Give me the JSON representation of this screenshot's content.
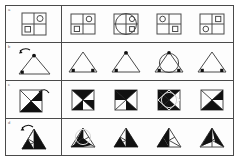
{
  "sheet": {
    "title": "Figure rotation reasoning worksheet",
    "width": 241,
    "height": 162,
    "background": "#ffffff",
    "line_color": "#4a4a4a",
    "fill_color": "#000000",
    "label_color": "#6b6b6b"
  },
  "layout": {
    "rows": 4,
    "options_per_row": 4,
    "question_column_width": 56,
    "frame": {
      "x": 5,
      "y": 5,
      "width": 229,
      "height": 151
    }
  },
  "rows": [
    {
      "label": "a",
      "prompt": {
        "name": "quad-grid-with-circle-and-square",
        "shape": "square-2x2-grid",
        "markers": [
          {
            "glyph": "circle",
            "cell": "top-right",
            "filled": false
          },
          {
            "glyph": "square",
            "cell": "bottom-left",
            "filled": false
          }
        ],
        "rotation_arrow": false
      },
      "options": [
        {
          "id": "a1",
          "shape": "square-2x2-grid",
          "markers": [
            {
              "glyph": "circle",
              "cell": "top-right",
              "filled": false
            },
            {
              "glyph": "square",
              "cell": "bottom-left",
              "filled": false
            }
          ],
          "overlay_circle": false
        },
        {
          "id": "a2",
          "shape": "square-2x2-grid",
          "markers": [
            {
              "glyph": "circle",
              "cell": "top-right",
              "filled": false
            },
            {
              "glyph": "square",
              "cell": "bottom-right",
              "filled": false
            }
          ],
          "overlay_circle": true
        },
        {
          "id": "a3",
          "shape": "square-2x2-grid",
          "markers": [
            {
              "glyph": "circle",
              "cell": "top-left",
              "filled": false
            },
            {
              "glyph": "square",
              "cell": "bottom-right",
              "filled": false
            }
          ],
          "overlay_circle": false
        },
        {
          "id": "a4",
          "shape": "square-2x2-grid",
          "markers": [
            {
              "glyph": "square",
              "cell": "top-right",
              "filled": false
            },
            {
              "glyph": "circle",
              "cell": "bottom-left",
              "filled": false
            }
          ],
          "overlay_circle": false
        }
      ]
    },
    {
      "label": "b",
      "prompt": {
        "name": "triangle-with-two-dots",
        "shape": "triangle",
        "markers": [
          {
            "glyph": "dot",
            "vertex": "apex",
            "filled": true
          },
          {
            "glyph": "dot",
            "vertex": "bottom-left",
            "filled": true
          }
        ],
        "rotation_arrow": true
      },
      "options": [
        {
          "id": "b1",
          "shape": "triangle",
          "markers": [
            {
              "glyph": "dot",
              "vertex": "bottom-left",
              "filled": true
            },
            {
              "glyph": "dot",
              "vertex": "bottom-right",
              "filled": true
            }
          ],
          "overlay_circle": false
        },
        {
          "id": "b2",
          "shape": "triangle",
          "markers": [
            {
              "glyph": "dot",
              "vertex": "apex",
              "filled": true
            },
            {
              "glyph": "dot",
              "vertex": "bottom-left",
              "filled": true
            }
          ],
          "overlay_circle": false
        },
        {
          "id": "b3",
          "shape": "triangle",
          "markers": [
            {
              "glyph": "dot",
              "vertex": "apex",
              "filled": true
            },
            {
              "glyph": "dot",
              "vertex": "bottom-left",
              "filled": true
            },
            {
              "glyph": "dot",
              "vertex": "bottom-right",
              "filled": true
            }
          ],
          "overlay_circle": true
        },
        {
          "id": "b4",
          "shape": "triangle",
          "markers": [
            {
              "glyph": "dot",
              "vertex": "bottom-left",
              "filled": true
            },
            {
              "glyph": "dot",
              "vertex": "bottom-right",
              "filled": true
            }
          ],
          "overlay_circle": false
        }
      ]
    },
    {
      "label": "c",
      "prompt": {
        "name": "square-quartered-by-diagonals",
        "shape": "square-diagonals",
        "filled_sectors": [
          "top-right-half",
          "bottom-left"
        ],
        "rotation_arrow": true
      },
      "options": [
        {
          "id": "c1",
          "shape": "square-diagonals",
          "filled_sectors": [
            "top",
            "right-lower"
          ],
          "overlay_circle": false
        },
        {
          "id": "c2",
          "shape": "square-diagonals",
          "filled_sectors": [
            "top",
            "bottom-right"
          ],
          "overlay_circle": false
        },
        {
          "id": "c3",
          "shape": "square-diagonals",
          "filled_sectors": [
            "top",
            "left",
            "bottom"
          ],
          "overlay_circle": true
        },
        {
          "id": "c4",
          "shape": "square-diagonals",
          "filled_sectors": [
            "right",
            "bottom-left"
          ],
          "overlay_circle": false
        }
      ]
    },
    {
      "label": "d",
      "prompt": {
        "name": "triangle-with-internal-lines",
        "shape": "triangle-subdivided",
        "filled_sectors": [
          "right-upper",
          "center-lower"
        ],
        "rotation_arrow": true
      },
      "options": [
        {
          "id": "d1",
          "shape": "triangle-subdivided",
          "filled_sectors": [
            "left",
            "right"
          ],
          "overlay_circle": true
        },
        {
          "id": "d2",
          "shape": "triangle-subdivided",
          "filled_sectors": [
            "upper-right",
            "lower-right"
          ],
          "overlay_circle": false
        },
        {
          "id": "d3",
          "shape": "triangle-subdivided",
          "filled_sectors": [
            "left-lower",
            "right-upper"
          ],
          "overlay_circle": false
        },
        {
          "id": "d4",
          "shape": "triangle-subdivided",
          "filled_sectors": [
            "upper",
            "right"
          ],
          "overlay_circle": false
        }
      ]
    }
  ]
}
